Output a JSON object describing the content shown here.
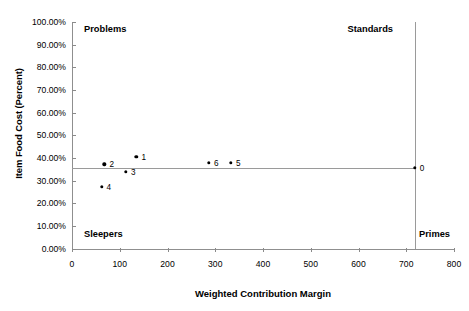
{
  "chart_data": {
    "type": "scatter",
    "title": "",
    "xlabel": "Weighted Contribution Margin",
    "ylabel": "Item Food Cost (Percent)",
    "xlim": [
      0,
      800
    ],
    "ylim": [
      0,
      1.0
    ],
    "xticks": [
      "0",
      "100",
      "200",
      "300",
      "400",
      "500",
      "600",
      "700",
      "800"
    ],
    "xtick_values": [
      0,
      100,
      200,
      300,
      400,
      500,
      600,
      700,
      800
    ],
    "yticks": [
      "0.00%",
      "10.00%",
      "20.00%",
      "30.00%",
      "40.00%",
      "50.00%",
      "60.00%",
      "70.00%",
      "80.00%",
      "90.00%",
      "100.00%"
    ],
    "ytick_values": [
      0,
      0.1,
      0.2,
      0.3,
      0.4,
      0.5,
      0.6,
      0.7,
      0.8,
      0.9,
      1.0
    ],
    "grid": false,
    "legend": "none",
    "points": [
      {
        "label": "0",
        "x": 718,
        "y": 0.355,
        "label_dx": 5,
        "label_dy": 0
      },
      {
        "label": "1",
        "x": 135,
        "y": 0.405,
        "label_dx": 5,
        "label_dy": 0
      },
      {
        "label": "2",
        "x": 68,
        "y": 0.372,
        "label_dx": 5,
        "label_dy": 0
      },
      {
        "label": "3",
        "x": 113,
        "y": 0.338,
        "label_dx": 5,
        "label_dy": 0
      },
      {
        "label": "4",
        "x": 62,
        "y": 0.272,
        "label_dx": 5,
        "label_dy": 0
      },
      {
        "label": "5",
        "x": 333,
        "y": 0.378,
        "label_dx": 5,
        "label_dy": 0
      },
      {
        "label": "6",
        "x": 287,
        "y": 0.378,
        "label_dx": 5,
        "label_dy": 0
      }
    ],
    "reference_lines": {
      "horizontal_value": 0.355,
      "vertical_value": 718
    },
    "quadrant_labels": {
      "top_left": "Problems",
      "top_right": "Standards",
      "bottom_left": "Sleepers",
      "bottom_right": "Primes"
    },
    "colors": {
      "point": "#000000",
      "axis": "#8f8f8f",
      "reference_line": "#9a9a9a",
      "background": "#ffffff",
      "text": "#000000"
    }
  }
}
